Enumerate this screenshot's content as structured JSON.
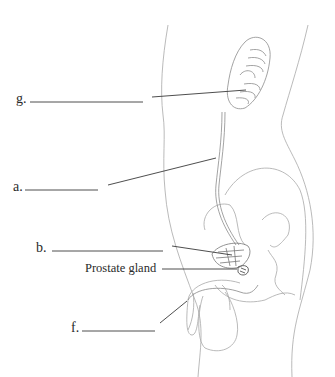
{
  "diagram": {
    "labels": [
      {
        "id": "g",
        "text": "g.",
        "blank": true
      },
      {
        "id": "a",
        "text": "a.",
        "blank": true
      },
      {
        "id": "b",
        "text": "b.",
        "blank": true
      },
      {
        "id": "prostate",
        "text": "Prostate gland",
        "blank": false
      },
      {
        "id": "f",
        "text": "f.",
        "blank": true
      }
    ],
    "colors": {
      "background": "#ffffff",
      "outline": "#9a9a9a",
      "leader_line": "#3a3a3a",
      "text": "#2a2a2a"
    }
  }
}
